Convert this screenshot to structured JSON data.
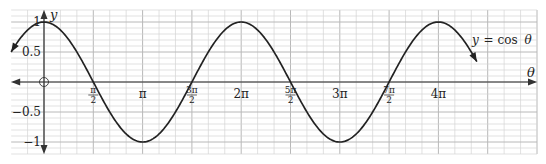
{
  "chart_data": {
    "type": "line",
    "title": "",
    "function": "y = cos θ",
    "xlabel": "θ",
    "ylabel": "y",
    "series": [
      {
        "name": "y = cos θ",
        "x_start_radians_over_pi": -0.333,
        "x_end_radians_over_pi": 4.39,
        "x": [
          "-π/3",
          "0",
          "π/2",
          "π",
          "3π/2",
          "2π",
          "5π/2",
          "3π",
          "7π/2",
          "4π",
          "4.39π"
        ],
        "values": [
          0.5,
          1,
          0,
          -1,
          0,
          1,
          0,
          -1,
          0,
          1,
          0.34
        ],
        "arrows_at_ends": true
      }
    ],
    "x_ticks": [
      {
        "value_over_pi": 0.5,
        "label_num": "π",
        "label_den": "2",
        "fraction": true
      },
      {
        "value_over_pi": 1,
        "label": "π",
        "fraction": false
      },
      {
        "value_over_pi": 1.5,
        "label_num": "3π",
        "label_den": "2",
        "fraction": true
      },
      {
        "value_over_pi": 2,
        "label": "2π",
        "fraction": false
      },
      {
        "value_over_pi": 2.5,
        "label_num": "5π",
        "label_den": "2",
        "fraction": true
      },
      {
        "value_over_pi": 3,
        "label": "3π",
        "fraction": false
      },
      {
        "value_over_pi": 3.5,
        "label_num": "7π",
        "label_den": "2",
        "fraction": true
      },
      {
        "value_over_pi": 4,
        "label": "4π",
        "fraction": false
      }
    ],
    "y_ticks": [
      {
        "value": 1,
        "label": "1"
      },
      {
        "value": 0.5,
        "label": "0.5"
      },
      {
        "value": -0.5,
        "label": "−0.5"
      },
      {
        "value": -1,
        "label": "−1"
      }
    ],
    "xlim_over_pi": [
      -0.333,
      5
    ],
    "ylim": [
      -1.2,
      1.2
    ],
    "grid": true,
    "origin_marker": "circle",
    "annotation": {
      "text_y": "y",
      "text_eq": "= cos",
      "text_theta": "θ"
    }
  },
  "colors": {
    "curve": "#222222",
    "axis": "#333333",
    "grid_minor": "#d4d4d4",
    "grid_major": "#b8b8b8"
  }
}
